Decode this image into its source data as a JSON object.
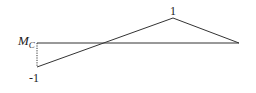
{
  "diagram": {
    "type": "influence-line",
    "labels": {
      "peak_value": "1",
      "left_value": "-1",
      "quantity_main": "M",
      "quantity_sub": "C"
    },
    "geometry": {
      "baseline": {
        "x1": 37,
        "y1": 43,
        "x2": 239,
        "y2": 43
      },
      "left_bottom": {
        "x": 37,
        "y": 67
      },
      "peak": {
        "x": 173,
        "y": 18
      },
      "right_end": {
        "x": 239,
        "y": 43
      }
    },
    "colors": {
      "line": "#333333",
      "text": "#222222"
    }
  }
}
